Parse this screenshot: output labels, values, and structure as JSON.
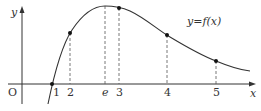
{
  "diagram": {
    "type": "function-graph",
    "axes": {
      "x_label": "x",
      "y_label": "y",
      "origin_label": "O"
    },
    "curve_label": "y=f(x)",
    "x_ticks": [
      {
        "label": "1",
        "px": 52
      },
      {
        "label": "2",
        "px": 70
      },
      {
        "label": "e",
        "px": 105,
        "italic": true
      },
      {
        "label": "3",
        "px": 119
      },
      {
        "label": "4",
        "px": 167
      },
      {
        "label": "5",
        "px": 216
      }
    ],
    "marked_points": [
      {
        "x": "1",
        "px": 52,
        "py": 84
      },
      {
        "x": "2",
        "px": 70,
        "py": 33
      },
      {
        "x": "3",
        "px": 119,
        "py": 8
      },
      {
        "x": "4",
        "px": 167,
        "py": 35
      },
      {
        "x": "5",
        "px": 216,
        "py": 61
      }
    ],
    "maximum_at": "e",
    "colors": {
      "curve": "#333333",
      "axis": "#333333",
      "dashed": "#555555"
    }
  }
}
